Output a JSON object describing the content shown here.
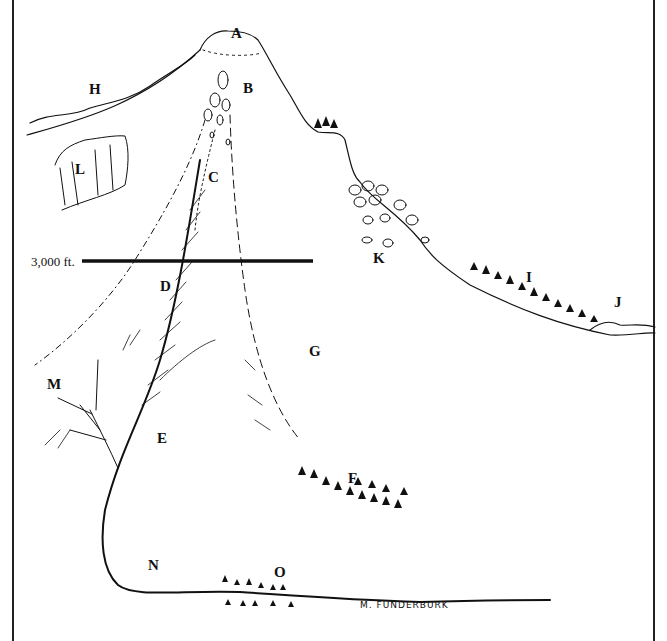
{
  "diagram": {
    "type": "hand-drawn mountain cross-section illustration",
    "labels": [
      {
        "id": "A",
        "text": "A",
        "x": 262,
        "y": 28
      },
      {
        "id": "B",
        "text": "B",
        "x": 244,
        "y": 81
      },
      {
        "id": "C",
        "text": "C",
        "x": 210,
        "y": 170
      },
      {
        "id": "D",
        "text": "D",
        "x": 162,
        "y": 279
      },
      {
        "id": "E",
        "text": "E",
        "x": 158,
        "y": 430
      },
      {
        "id": "F",
        "text": "F",
        "x": 349,
        "y": 471
      },
      {
        "id": "G",
        "text": "G",
        "x": 310,
        "y": 345
      },
      {
        "id": "H",
        "text": "H",
        "x": 90,
        "y": 82
      },
      {
        "id": "I",
        "text": "I",
        "x": 525,
        "y": 270
      },
      {
        "id": "J",
        "text": "J",
        "x": 614,
        "y": 295
      },
      {
        "id": "K",
        "text": "K",
        "x": 372,
        "y": 251
      },
      {
        "id": "L",
        "text": "L",
        "x": 75,
        "y": 160
      },
      {
        "id": "M",
        "text": "M",
        "x": 48,
        "y": 376
      },
      {
        "id": "N",
        "text": "N",
        "x": 148,
        "y": 558
      },
      {
        "id": "O",
        "text": "O",
        "x": 275,
        "y": 565
      }
    ],
    "elevation_line": {
      "label": "3,000 ft.",
      "x1": 82,
      "x2": 313,
      "y": 261
    },
    "signature": "M. FUNDERBURK",
    "colors": {
      "ink": "#111111",
      "background": "#ffffff"
    }
  }
}
